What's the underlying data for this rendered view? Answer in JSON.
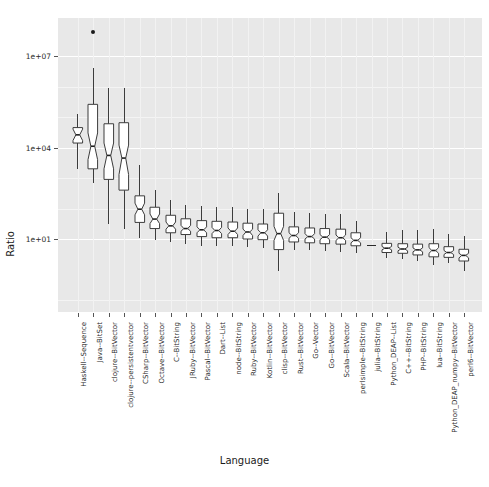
{
  "chart_data": {
    "type": "boxplot",
    "title": "",
    "xlabel": "Language",
    "ylabel": "Ratio",
    "y_scale": "log10",
    "ylim": [
      0.3,
      60000000
    ],
    "grid": true,
    "legend": "none",
    "y_ticks": [
      {
        "label": "1e+01",
        "value": 10
      },
      {
        "label": "1e+04",
        "value": 10000
      },
      {
        "label": "1e+07",
        "value": 10000000
      }
    ],
    "categories": [
      "Haskell--Sequence",
      "Java--BitSet",
      "clojure--BitVector",
      "clojure--persistentvector",
      "CSharp--BitVector",
      "Octave--BitVector",
      "C--BitString",
      "JRuby--BitVector",
      "Pascal--BitVector",
      "Dart--List",
      "node--BitString",
      "Ruby--BitVector",
      "Kotlin--BitVector",
      "clisp--BitVector",
      "Rust--BitVector",
      "Go--Vector",
      "Go--BitVector",
      "Scala--BitVector",
      "perlsimple--BitString",
      "julia--BitString",
      "Python_DEAP--List",
      "C++--BitString",
      "PHP--BitString",
      "lua--BitString",
      "Python_DEAP_numpy--BitVector",
      "perl6--BitVector"
    ],
    "boxes": [
      {
        "category": "Haskell--Sequence",
        "min": 2000,
        "q1": 14000,
        "median": 26000,
        "q3": 45000,
        "max": 130000,
        "notch_low": 17000,
        "notch_high": 40000,
        "outliers": []
      },
      {
        "category": "Java--BitSet",
        "min": 700,
        "q1": 2000,
        "median": 11000,
        "q3": 260000,
        "max": 4000000,
        "notch_low": 4000,
        "notch_high": 30000,
        "outliers": [
          60000000
        ]
      },
      {
        "category": "clojure--BitVector",
        "min": 30,
        "q1": 900,
        "median": 5500,
        "q3": 60000,
        "max": 900000,
        "notch_low": 2000,
        "notch_high": 14000,
        "outliers": []
      },
      {
        "category": "clojure--persistentvector",
        "min": 22,
        "q1": 400,
        "median": 4500,
        "q3": 65000,
        "max": 900000,
        "notch_low": 1300,
        "notch_high": 12000,
        "outliers": []
      },
      {
        "category": "CSharp--BitVector",
        "min": 11,
        "q1": 35,
        "median": 95,
        "q3": 260,
        "max": 2600,
        "notch_low": 62,
        "notch_high": 150,
        "outliers": []
      },
      {
        "category": "Octave--BitVector",
        "min": 9,
        "q1": 22,
        "median": 45,
        "q3": 110,
        "max": 400,
        "notch_low": 32,
        "notch_high": 66,
        "outliers": []
      },
      {
        "category": "C--BitString",
        "min": 8,
        "q1": 16,
        "median": 27,
        "q3": 60,
        "max": 190,
        "notch_low": 21,
        "notch_high": 36,
        "outliers": []
      },
      {
        "category": "JRuby--BitVector",
        "min": 7,
        "q1": 14,
        "median": 22,
        "q3": 46,
        "max": 130,
        "notch_low": 18,
        "notch_high": 28,
        "outliers": []
      },
      {
        "category": "Pascal--BitVector",
        "min": 6,
        "q1": 12,
        "median": 20,
        "q3": 40,
        "max": 120,
        "notch_low": 16,
        "notch_high": 25,
        "outliers": []
      },
      {
        "category": "Dart--List",
        "min": 6,
        "q1": 11,
        "median": 19,
        "q3": 38,
        "max": 115,
        "notch_low": 15,
        "notch_high": 24,
        "outliers": []
      },
      {
        "category": "node--BitString",
        "min": 6,
        "q1": 11,
        "median": 18,
        "q3": 36,
        "max": 110,
        "notch_low": 14,
        "notch_high": 23,
        "outliers": []
      },
      {
        "category": "Ruby--BitVector",
        "min": 5.5,
        "q1": 10,
        "median": 17,
        "q3": 33,
        "max": 100,
        "notch_low": 13,
        "notch_high": 21,
        "outliers": []
      },
      {
        "category": "Kotlin--BitVector",
        "min": 5,
        "q1": 9.5,
        "median": 16,
        "q3": 31,
        "max": 95,
        "notch_low": 12.5,
        "notch_high": 20,
        "outliers": []
      },
      {
        "category": "clisp--BitVector",
        "min": 0.9,
        "q1": 4.5,
        "median": 15,
        "q3": 70,
        "max": 330,
        "notch_low": 9,
        "notch_high": 26,
        "outliers": []
      },
      {
        "category": "Rust--BitVector",
        "min": 4.5,
        "q1": 8,
        "median": 13,
        "q3": 25,
        "max": 78,
        "notch_low": 10.5,
        "notch_high": 16,
        "outliers": []
      },
      {
        "category": "Go--Vector",
        "min": 4.2,
        "q1": 7.5,
        "median": 12,
        "q3": 23,
        "max": 72,
        "notch_low": 10,
        "notch_high": 15,
        "outliers": []
      },
      {
        "category": "Go--BitVector",
        "min": 4,
        "q1": 7,
        "median": 11.5,
        "q3": 22,
        "max": 68,
        "notch_low": 9.5,
        "notch_high": 14,
        "outliers": []
      },
      {
        "category": "Scala--BitVector",
        "min": 3.8,
        "q1": 6.8,
        "median": 11,
        "q3": 21,
        "max": 64,
        "notch_low": 9,
        "notch_high": 13.5,
        "outliers": []
      },
      {
        "category": "perlsimple--BitString",
        "min": 3.5,
        "q1": 6,
        "median": 9,
        "q3": 16,
        "max": 40,
        "notch_low": 7.5,
        "notch_high": 11,
        "outliers": []
      },
      {
        "category": "julia--BitString",
        "min": 6.5,
        "q1": 6.5,
        "median": 6.5,
        "q3": 6.5,
        "max": 6.5,
        "notch_low": 6.5,
        "notch_high": 6.5,
        "outliers": []
      },
      {
        "category": "Python_DEAP--List",
        "min": 2.4,
        "q1": 3.6,
        "median": 5.0,
        "q3": 7.2,
        "max": 17,
        "notch_low": 4.4,
        "notch_high": 5.7,
        "outliers": []
      },
      {
        "category": "C++--BitString",
        "min": 2.2,
        "q1": 3.4,
        "median": 4.7,
        "q3": 7.0,
        "max": 19,
        "notch_low": 4.1,
        "notch_high": 5.4,
        "outliers": []
      },
      {
        "category": "PHP--BitString",
        "min": 1.9,
        "q1": 3.0,
        "median": 4.4,
        "q3": 6.8,
        "max": 19,
        "notch_low": 3.8,
        "notch_high": 5.1,
        "outliers": []
      },
      {
        "category": "lua--BitString",
        "min": 1.4,
        "q1": 2.6,
        "median": 4.2,
        "q3": 7.0,
        "max": 21,
        "notch_low": 3.4,
        "notch_high": 5.2,
        "outliers": []
      },
      {
        "category": "Python_DEAP_numpy--BitVector",
        "min": 1.6,
        "q1": 2.5,
        "median": 3.6,
        "q3": 5.6,
        "max": 15,
        "notch_low": 3.1,
        "notch_high": 4.2,
        "outliers": []
      },
      {
        "category": "perl6--BitVector",
        "min": 0.9,
        "q1": 1.9,
        "median": 2.9,
        "q3": 4.6,
        "max": 13,
        "notch_low": 2.4,
        "notch_high": 3.4,
        "outliers": []
      }
    ],
    "colors": {
      "panel_background": "#e8e8e8",
      "grid_major": "#ffffff",
      "box_fill": "#ffffff",
      "box_outline": "#3c3c3c",
      "median": "#2a2a2a",
      "outlier": "#1a1a1a",
      "text": "#2b2b2b"
    }
  }
}
